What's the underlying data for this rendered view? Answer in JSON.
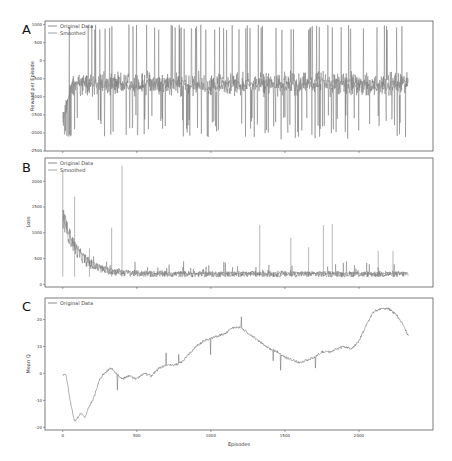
{
  "chart_data": [
    {
      "panel": "A",
      "type": "line",
      "ylabel": "Reward per Episode",
      "xlabel": "",
      "ylim": [
        -2500,
        1100
      ],
      "xlim": [
        -120,
        2500
      ],
      "yticks": [
        -2500,
        -2000,
        -1500,
        -1000,
        -500,
        0,
        500,
        1000
      ],
      "xticks": [
        0,
        500,
        1000,
        1500,
        2000
      ],
      "legend": [
        "Original Data",
        "Smoothed"
      ],
      "legend_position": "top-left",
      "series": [
        {
          "name": "Original Data",
          "description": "Noisy reward around -500 to -1000 with frequent spikes up to ~1000 and dips to ~-2200; episodes 0-2333",
          "x_range": [
            0,
            2333
          ],
          "baseline": -700,
          "spike_max": 1000,
          "dip_min": -2200
        },
        {
          "name": "Smoothed",
          "description": "Smoothed reward around -700 (starts near -1700 at episode 0)",
          "x_range": [
            0,
            2333
          ],
          "start": -1700,
          "plateau": -650
        }
      ]
    },
    {
      "panel": "B",
      "type": "line",
      "ylabel": "Loss",
      "xlabel": "",
      "ylim": [
        -50,
        2450
      ],
      "xlim": [
        -120,
        2500
      ],
      "yticks": [
        0,
        500,
        1000,
        1500,
        2000
      ],
      "xticks": [
        0,
        500,
        1000,
        1500,
        2000
      ],
      "legend": [
        "Original Data",
        "Smoothed"
      ],
      "legend_position": "top-left",
      "series": [
        {
          "name": "Original Data",
          "description": "Loss starts ~1300-1700 (spike ~2200 at episode 0), decays to ~200 by episode ~300, then noisy ~150-350 with spikes",
          "x_range": [
            0,
            2333
          ],
          "spikes": [
            [
              0,
              2200
            ],
            [
              80,
              1700
            ],
            [
              180,
              700
            ],
            [
              330,
              1100
            ],
            [
              400,
              2300
            ],
            [
              1330,
              1150
            ],
            [
              1540,
              900
            ],
            [
              1660,
              720
            ],
            [
              1760,
              1150
            ],
            [
              1820,
              1170
            ],
            [
              2130,
              650
            ],
            [
              2230,
              650
            ]
          ]
        },
        {
          "name": "Smoothed",
          "description": "Exponential decay from ~1300 to ~220",
          "x_range": [
            0,
            2333
          ],
          "start": 1300,
          "end": 220
        }
      ]
    },
    {
      "panel": "C",
      "type": "line",
      "ylabel": "Mean Q",
      "xlabel": "Episodes",
      "ylim": [
        -21,
        28
      ],
      "xlim": [
        -120,
        2500
      ],
      "yticks": [
        -20,
        -10,
        0,
        10,
        20
      ],
      "xticks": [
        0,
        500,
        1000,
        1500,
        2000
      ],
      "legend": [
        "Original Data"
      ],
      "legend_position": "top-left",
      "series": [
        {
          "name": "Original Data",
          "x": [
            0,
            20,
            50,
            80,
            120,
            150,
            180,
            210,
            250,
            280,
            300,
            330,
            360,
            400,
            450,
            500,
            550,
            600,
            650,
            700,
            750,
            800,
            850,
            900,
            950,
            1000,
            1050,
            1100,
            1150,
            1200,
            1250,
            1300,
            1350,
            1400,
            1450,
            1500,
            1550,
            1600,
            1650,
            1700,
            1750,
            1800,
            1850,
            1900,
            1950,
            2000,
            2050,
            2100,
            2150,
            2200,
            2250,
            2300,
            2333
          ],
          "y": [
            -1,
            0,
            -10,
            -18,
            -15,
            -16,
            -12,
            -9,
            -2,
            0,
            1,
            2,
            0,
            -2,
            -1,
            -2,
            0,
            -1,
            2,
            3,
            3,
            4,
            7,
            10,
            12,
            13,
            14,
            15,
            17,
            17,
            15,
            13,
            11,
            9,
            8,
            6,
            5,
            4,
            5,
            6,
            8,
            8,
            9,
            10,
            9,
            12,
            18,
            23,
            24,
            24,
            22,
            18,
            14
          ]
        }
      ]
    }
  ],
  "panels": {
    "A": {
      "letter": "A",
      "ylabel": "Reward per Episode"
    },
    "B": {
      "letter": "B",
      "ylabel": "Loss"
    },
    "C": {
      "letter": "C",
      "ylabel": "Mean Q",
      "xlabel": "Episodes"
    }
  },
  "legend": {
    "original": "Original Data",
    "smoothed": "Smoothed"
  },
  "colors": {
    "original": "#6e6e6e",
    "smoothed": "#8a8a8a",
    "frame": "#444444"
  }
}
